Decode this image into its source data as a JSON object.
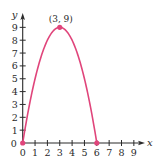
{
  "chart_data": {
    "type": "line",
    "title": "",
    "xlabel": "x",
    "ylabel": "y",
    "xlim": [
      0,
      9
    ],
    "ylim": [
      0,
      9
    ],
    "x_ticks": [
      0,
      1,
      2,
      3,
      4,
      5,
      6,
      7,
      8,
      9
    ],
    "y_ticks": [
      0,
      1,
      2,
      3,
      4,
      5,
      6,
      7,
      8,
      9
    ],
    "grid": false,
    "series": [
      {
        "name": "parabola",
        "equation": "y = -x^2 + 6x",
        "x": [
          0,
          0.5,
          1,
          1.5,
          2,
          2.5,
          3,
          3.5,
          4,
          4.5,
          5,
          5.5,
          6
        ],
        "y": [
          0,
          2.75,
          5,
          6.75,
          8,
          8.75,
          9,
          8.75,
          8,
          6.75,
          5,
          2.75,
          0
        ],
        "color": "#e0457b"
      }
    ],
    "points": [
      {
        "x": 0,
        "y": 0
      },
      {
        "x": 3,
        "y": 9
      },
      {
        "x": 6,
        "y": 0
      }
    ],
    "annotations": [
      {
        "text": "(3, 9)",
        "x": 3,
        "y": 9
      }
    ]
  },
  "colors": {
    "curve": "#e0457b",
    "axis": "#2a2a2a"
  }
}
